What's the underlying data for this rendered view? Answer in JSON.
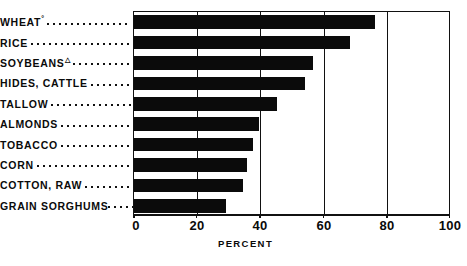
{
  "chart_data": {
    "type": "bar",
    "orientation": "horizontal",
    "title": "",
    "xlabel": "PERCENT",
    "ylabel": "",
    "xlim": [
      0,
      100
    ],
    "xticks": [
      "0",
      "20",
      "40",
      "60",
      "80",
      "100"
    ],
    "xtick_values": [
      0,
      20,
      40,
      60,
      80,
      100
    ],
    "grid": true,
    "grid_axis": "x",
    "legend": "none",
    "bar_color": "#0b0b0b",
    "categories": [
      "WHEAT",
      "RICE",
      "SOYBEANS",
      "HIDES, CATTLE",
      "TALLOW",
      "ALMONDS",
      "TOBACCO",
      "CORN",
      "COTTON, RAW",
      "GRAIN SORGHUMS"
    ],
    "category_marks": [
      "°",
      "",
      "△",
      "",
      "",
      "",
      "",
      "",
      "",
      ""
    ],
    "values": [
      76,
      68,
      56.5,
      54,
      45,
      39.5,
      37.5,
      35.5,
      34.5,
      29
    ]
  },
  "axis": {
    "title": "PERCENT",
    "ticks": [
      "0",
      "20",
      "40",
      "60",
      "80",
      "100"
    ]
  },
  "rows": [
    {
      "label": "WHEAT",
      "mark": "°",
      "value": 76
    },
    {
      "label": "RICE",
      "mark": "",
      "value": 68
    },
    {
      "label": "SOYBEANS",
      "mark": "△",
      "value": 56.5
    },
    {
      "label": "HIDES, CATTLE",
      "mark": "",
      "value": 54
    },
    {
      "label": "TALLOW",
      "mark": "",
      "value": 45
    },
    {
      "label": "ALMONDS",
      "mark": "",
      "value": 39.5
    },
    {
      "label": "TOBACCO",
      "mark": "",
      "value": 37.5
    },
    {
      "label": "CORN",
      "mark": "",
      "value": 35.5
    },
    {
      "label": "COTTON, RAW",
      "mark": "",
      "value": 34.5
    },
    {
      "label": "GRAIN SORGHUMS",
      "mark": "",
      "value": 29
    }
  ]
}
